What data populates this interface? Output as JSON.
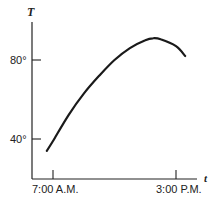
{
  "chart_data": {
    "type": "line",
    "title": "",
    "xlabel": "t",
    "ylabel": "T",
    "x_ticks": [
      {
        "label": "7:00 A.M.",
        "hours": 7
      },
      {
        "label": "3:00 P.M.",
        "hours": 15
      }
    ],
    "y_ticks": [
      {
        "label": "40°",
        "value": 40
      },
      {
        "label": "80°",
        "value": 80
      }
    ],
    "series": [
      {
        "name": "Temperature",
        "x_hours": [
          6.6,
          7.0,
          8.0,
          9.0,
          10.0,
          11.0,
          12.0,
          13.0,
          13.5,
          14.0,
          15.0,
          15.6
        ],
        "values": [
          34,
          39,
          52,
          63,
          72,
          80,
          86,
          90,
          91,
          90.5,
          87,
          82
        ]
      }
    ],
    "grid": false,
    "legend": "none"
  },
  "labels": {
    "y_axis": "T",
    "x_axis": "t",
    "y_tick_80": "80°",
    "y_tick_40": "40°",
    "x_tick_start": "7:00 A.M.",
    "x_tick_end": "3:00 P.M."
  }
}
